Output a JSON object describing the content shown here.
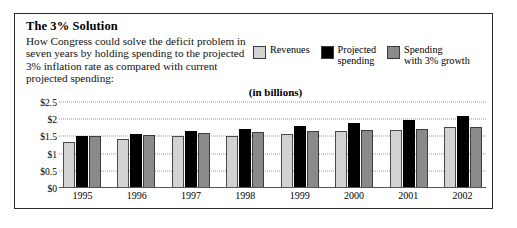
{
  "figure": {
    "title": "The 3% Solution",
    "subtitle": "How Congress could solve the deficit problem in seven years by holding spending to the projected 3% inflation rate as compared with current projected spending:",
    "units_caption": "(in billions)"
  },
  "legend": {
    "position": "top-right",
    "items": [
      {
        "label": "Revenues",
        "color": "#d2d2d2",
        "icon": "legend-swatch-icon"
      },
      {
        "label": "Projected\nspending",
        "color": "#000000",
        "icon": "legend-swatch-icon"
      },
      {
        "label": "Spending\nwith 3% growth",
        "color": "#8a8a8a",
        "icon": "legend-swatch-icon"
      }
    ]
  },
  "axis": {
    "yticks": [
      "$2.5",
      "$2",
      "$1.5",
      "$1",
      "$0.5",
      "$0"
    ],
    "ytick_values": [
      2.5,
      2,
      1.5,
      1,
      0.5,
      0
    ]
  },
  "chart_data": {
    "type": "bar",
    "title": "The 3% Solution",
    "subtitle": "(in billions)",
    "xlabel": "",
    "ylabel": "",
    "ylim": [
      0,
      2.5
    ],
    "ytick_labels": [
      "$0",
      "$0.5",
      "$1",
      "$1.5",
      "$2",
      "$2.5"
    ],
    "grid": true,
    "legend_position": "top-right",
    "categories": [
      "1995",
      "1996",
      "1997",
      "1998",
      "1999",
      "2000",
      "2001",
      "2002"
    ],
    "series": [
      {
        "name": "Revenues",
        "color": "#d2d2d2",
        "values": [
          1.35,
          1.43,
          1.5,
          1.52,
          1.58,
          1.65,
          1.7,
          1.78
        ]
      },
      {
        "name": "Projected spending",
        "color": "#000000",
        "values": [
          1.52,
          1.58,
          1.65,
          1.72,
          1.8,
          1.88,
          1.97,
          2.08
        ]
      },
      {
        "name": "Spending with 3% growth",
        "color": "#8a8a8a",
        "values": [
          1.52,
          1.55,
          1.6,
          1.63,
          1.66,
          1.7,
          1.73,
          1.77
        ]
      }
    ]
  }
}
